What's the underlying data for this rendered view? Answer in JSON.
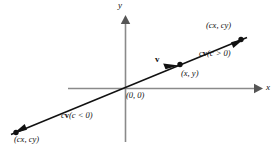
{
  "figure": {
    "background_color": "#ffffff",
    "axis_color": "#8a8a8a",
    "line_color": "#111111",
    "text_color": "#111111",
    "width": 278,
    "height": 150
  },
  "axes": {
    "x_label": "x",
    "y_label": "y",
    "origin_label": "(0, 0)",
    "origin_px": {
      "x": 125,
      "y": 88
    },
    "x_axis": {
      "x1": 68,
      "y1": 88,
      "x2": 258,
      "y2": 88,
      "arrow": "right"
    },
    "y_axis": {
      "x1": 125,
      "y1": 142,
      "x2": 125,
      "y2": 18,
      "arrow": "up"
    },
    "x_label_px": {
      "x": 264,
      "y": 84
    },
    "y_label_px": {
      "x": 118,
      "y": 2
    }
  },
  "line": {
    "name": "vector-line",
    "from_px": {
      "x": 12,
      "y": 134
    },
    "to_px": {
      "x": 246,
      "y": 38
    },
    "slope_note": "line through origin with positive slope"
  },
  "points": [
    {
      "id": "point-cxcy-positive",
      "label": "(cx, cy)",
      "point_px": {
        "x": 240,
        "y": 40
      },
      "label_px": {
        "x": 205,
        "y": 22
      }
    },
    {
      "id": "point-xy",
      "label": "(x,  y)",
      "point_px": {
        "x": 180,
        "y": 65
      },
      "label_px": {
        "x": 180,
        "y": 70
      }
    },
    {
      "id": "point-cxcy-negative",
      "label": "(cx, cy)",
      "point_px": {
        "x": 16,
        "y": 132
      },
      "label_px": {
        "x": 15,
        "y": 136
      }
    }
  ],
  "vectors": [
    {
      "id": "vector-v",
      "label": "v",
      "label_px": {
        "x": 156,
        "y": 56
      },
      "arrow_tip_px": {
        "x": 178,
        "y": 66
      },
      "description": "unit vector v along the line"
    },
    {
      "id": "vector-cv-positive",
      "label_prefix": "c",
      "label_vector": "v",
      "label_condition": "(c > 0)",
      "label_full": "cv(c > 0)",
      "label_px": {
        "x": 200,
        "y": 50
      },
      "arrow_tip_px": {
        "x": 244,
        "y": 39
      }
    },
    {
      "id": "vector-cv-negative",
      "label_prefix": "c",
      "label_vector": "v",
      "label_condition": "(c < 0)",
      "label_full": "cv(c < 0)",
      "label_px": {
        "x": 62,
        "y": 112
      },
      "arrow_tip_px": {
        "x": 14,
        "y": 133
      }
    }
  ]
}
